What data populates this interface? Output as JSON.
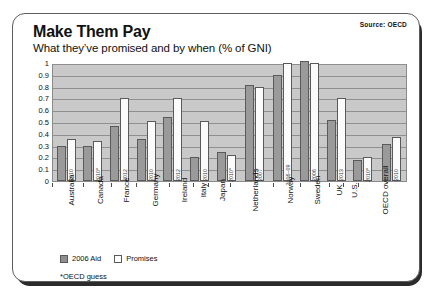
{
  "card": {
    "title": "Make Them Pay",
    "subtitle": "What they’ve promised and by when (% of GNI)",
    "source": "Source: OECD",
    "footnote": "*OECD guess"
  },
  "legend": {
    "aid_label": "2006 Aid",
    "promises_label": "Promises"
  },
  "chart_data": {
    "type": "bar",
    "title": "Make Them Pay",
    "subtitle": "What they’ve promised and by when (% of GNI)",
    "xlabel": "",
    "ylabel": "",
    "ylim": [
      0,
      1
    ],
    "yticks": [
      "0",
      "0.1",
      "0.2",
      "0.3",
      "0.4",
      "0.5",
      "0.6",
      "0.7",
      "0.8",
      "0.9",
      "1"
    ],
    "grid": true,
    "legend_position": "bottom-left",
    "categories": [
      "Australia",
      "Canada",
      "France",
      "Germany",
      "Ireland",
      "Italy",
      "Japan",
      "Netherlands",
      "Norway",
      "Sweden",
      "UK",
      "U.S.",
      "OECD overall"
    ],
    "target_years": [
      "2010",
      "2010*",
      "2012",
      "2010",
      "2012",
      "2010",
      "2010*",
      "2007",
      "2006–09",
      "2006",
      "2013",
      "2010*",
      "2010"
    ],
    "series": [
      {
        "name": "2006 Aid",
        "color": "#9a9a9a",
        "values": [
          0.3,
          0.3,
          0.47,
          0.36,
          0.54,
          0.2,
          0.25,
          0.81,
          0.9,
          1.02,
          0.52,
          0.18,
          0.31
        ]
      },
      {
        "name": "Promises",
        "color": "#fbfbfb",
        "values": [
          0.36,
          0.34,
          0.7,
          0.51,
          0.7,
          0.51,
          0.22,
          0.8,
          1.0,
          1.0,
          0.7,
          0.2,
          0.37
        ]
      }
    ]
  }
}
